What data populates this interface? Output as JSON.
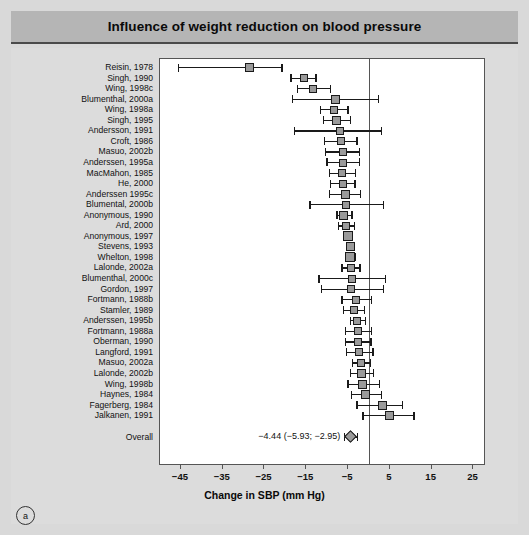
{
  "figure": {
    "title": "Influence of weight reduction on blood pressure",
    "panel_letter": "a"
  },
  "chart_data": {
    "type": "scatter",
    "subtype": "forest-plot",
    "title": "Influence of weight reduction on blood pressure",
    "xlabel": "Change in SBP (mm Hg)",
    "ylabel": "",
    "xlim": [
      -50,
      28
    ],
    "xticks": [
      -45,
      -35,
      -25,
      -15,
      -5,
      5,
      15,
      25
    ],
    "xticklabels": [
      "−45",
      "−35",
      "−25",
      "−15",
      "−5",
      "5",
      "15",
      "25"
    ],
    "grid": false,
    "legend": null,
    "reference_line": 0,
    "effect_measure": "Change in SBP (mm Hg)",
    "categories": [
      "Reisin, 1978",
      "Singh, 1990",
      "Wing, 1998c",
      "Blumenthal, 2000a",
      "Wing, 1998a",
      "Singh, 1995",
      "Andersson, 1991",
      "Croft, 1986",
      "Masuo, 2002b",
      "Anderssen, 1995a",
      "MacMahon, 1985",
      "He, 2000",
      "Anderssen 1995c",
      "Blumental, 2000b",
      "Anonymous, 1990",
      "Ard, 2000",
      "Anonymous, 1997",
      "Stevens, 1993",
      "Whelton, 1998",
      "Lalonde, 2002a",
      "Blumenthal, 2000c",
      "Gordon, 1997",
      "Fortmann, 1988b",
      "Stamler, 1989",
      "Anderssen, 1995b",
      "Fortmann, 1988a",
      "Oberman, 1990",
      "Langford, 1991",
      "Masuo, 2002a",
      "Lalonde, 2002b",
      "Wing, 1998b",
      "Haynes, 1984",
      "Fagerberg, 1984",
      "Jalkanen, 1991"
    ],
    "studies": [
      {
        "label": "Reisin, 1978",
        "estimate": -28.5,
        "ci_low": -45.8,
        "ci_high": -21.0,
        "marker_size": 9
      },
      {
        "label": "Singh, 1990",
        "estimate": -15.5,
        "ci_low": -18.8,
        "ci_high": -12.8,
        "marker_size": 8
      },
      {
        "label": "Wing, 1998c",
        "estimate": -13.5,
        "ci_low": -17.2,
        "ci_high": -9.4,
        "marker_size": 8
      },
      {
        "label": "Blumenthal, 2000a",
        "estimate": -8.0,
        "ci_low": -18.5,
        "ci_high": 2.2,
        "marker_size": 9
      },
      {
        "label": "Wing, 1998a",
        "estimate": -8.3,
        "ci_low": -11.8,
        "ci_high": -5.2,
        "marker_size": 8
      },
      {
        "label": "Singh, 1995",
        "estimate": -7.7,
        "ci_low": -11.0,
        "ci_high": -4.5,
        "marker_size": 9
      },
      {
        "label": "Andersson, 1991",
        "estimate": -7.0,
        "ci_low": -18.0,
        "ci_high": 2.9,
        "marker_size": 8
      },
      {
        "label": "Croft, 1986",
        "estimate": -6.8,
        "ci_low": -10.8,
        "ci_high": -3.0,
        "marker_size": 8
      },
      {
        "label": "Masuo, 2002b",
        "estimate": -6.2,
        "ci_low": -10.5,
        "ci_high": -2.5,
        "marker_size": 8
      },
      {
        "label": "Anderssen, 1995a",
        "estimate": -6.2,
        "ci_low": -10.2,
        "ci_high": -2.5,
        "marker_size": 8
      },
      {
        "label": "MacMahon, 1985",
        "estimate": -6.4,
        "ci_low": -9.6,
        "ci_high": -3.4,
        "marker_size": 8
      },
      {
        "label": "He, 2000",
        "estimate": -6.3,
        "ci_low": -9.4,
        "ci_high": -3.5,
        "marker_size": 8
      },
      {
        "label": "Anderssen 1995c",
        "estimate": -5.6,
        "ci_low": -9.6,
        "ci_high": -2.1,
        "marker_size": 9
      },
      {
        "label": "Blumental, 2000b",
        "estimate": -5.5,
        "ci_low": -14.3,
        "ci_high": 3.3,
        "marker_size": 8
      },
      {
        "label": "Anonymous, 1990",
        "estimate": -6.0,
        "ci_low": -7.8,
        "ci_high": -4.2,
        "marker_size": 9
      },
      {
        "label": "Ard, 2000",
        "estimate": -5.6,
        "ci_low": -7.4,
        "ci_high": -3.6,
        "marker_size": 8
      },
      {
        "label": "Anonymous, 1997",
        "estimate": -5.0,
        "ci_low": -5.5,
        "ci_high": -4.5,
        "marker_size": 10
      },
      {
        "label": "Stevens, 1993",
        "estimate": -4.5,
        "ci_low": -5.4,
        "ci_high": -3.6,
        "marker_size": 9
      },
      {
        "label": "Whelton, 1998",
        "estimate": -4.5,
        "ci_low": -5.6,
        "ci_high": -3.4,
        "marker_size": 10
      },
      {
        "label": "Lalonde, 2002a",
        "estimate": -4.4,
        "ci_low": -6.6,
        "ci_high": -2.3,
        "marker_size": 8
      },
      {
        "label": "Blumenthal, 2000c",
        "estimate": -4.1,
        "ci_low": -12.1,
        "ci_high": 3.8,
        "marker_size": 8
      },
      {
        "label": "Gordon, 1997",
        "estimate": -4.2,
        "ci_low": -11.5,
        "ci_high": 3.3,
        "marker_size": 8
      },
      {
        "label": "Fortmann, 1988b",
        "estimate": -3.2,
        "ci_low": -6.6,
        "ci_high": 0.5,
        "marker_size": 8
      },
      {
        "label": "Stamler, 1989",
        "estimate": -3.6,
        "ci_low": -6.3,
        "ci_high": -1.2,
        "marker_size": 8
      },
      {
        "label": "Anderssen, 1995b",
        "estimate": -2.8,
        "ci_low": -4.5,
        "ci_high": -1.0,
        "marker_size": 8
      },
      {
        "label": "Fortmann, 1988a",
        "estimate": -2.7,
        "ci_low": -5.8,
        "ci_high": 0.4,
        "marker_size": 8
      },
      {
        "label": "Oberman, 1990",
        "estimate": -2.7,
        "ci_low": -5.8,
        "ci_high": 0.3,
        "marker_size": 8
      },
      {
        "label": "Langford, 1991",
        "estimate": -2.5,
        "ci_low": -5.5,
        "ci_high": 0.8,
        "marker_size": 8
      },
      {
        "label": "Masuo, 2002a",
        "estimate": -2.0,
        "ci_low": -4.1,
        "ci_high": 0.2,
        "marker_size": 8
      },
      {
        "label": "Lalonde, 2002b",
        "estimate": -1.8,
        "ci_low": -4.6,
        "ci_high": 0.9,
        "marker_size": 9
      },
      {
        "label": "Wing, 1998b",
        "estimate": -1.5,
        "ci_low": -5.2,
        "ci_high": 2.3,
        "marker_size": 9
      },
      {
        "label": "Haynes, 1984",
        "estimate": -0.8,
        "ci_low": -4.4,
        "ci_high": 2.8,
        "marker_size": 9
      },
      {
        "label": "Fagerberg, 1984",
        "estimate": 3.2,
        "ci_low": -3.0,
        "ci_high": 7.8,
        "marker_size": 9
      },
      {
        "label": "Jalkanen, 1991",
        "estimate": 4.8,
        "ci_low": -1.6,
        "ci_high": 10.6,
        "marker_size": 9
      }
    ],
    "overall": {
      "label": "Overall",
      "estimate": -4.44,
      "ci_low": -5.93,
      "ci_high": -2.95,
      "text": "−4.44 (−5.93; −2.95)"
    },
    "colors": {
      "marker_fill": "#9a9a9a",
      "marker_edge": "#1a1a1a",
      "line": "#1a1a1a",
      "axis": "#555555",
      "title_bar": "#b5b5b5",
      "background": "#d9d9d9",
      "plot_background": "#ffffff"
    }
  }
}
